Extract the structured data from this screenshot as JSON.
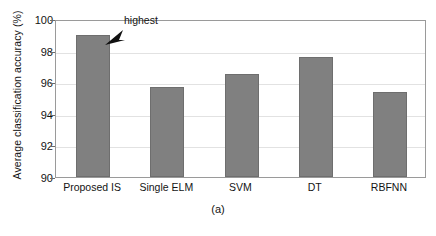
{
  "chart_data": {
    "type": "bar",
    "title": "",
    "subtitle": "",
    "xlabel": "",
    "ylabel": "Average classification accuracy (%)",
    "categories": [
      "Proposed IS",
      "Single  ELM",
      "SVM",
      "DT",
      "RBFNN"
    ],
    "values": [
      99.0,
      95.7,
      96.5,
      97.6,
      95.4
    ],
    "ylim": [
      90,
      100
    ],
    "yticks": [
      90,
      92,
      94,
      96,
      98,
      100
    ],
    "ytick_labels": [
      "90",
      "92",
      "94",
      "96",
      "98",
      "100"
    ],
    "grid": true,
    "grid_axis": "y",
    "legend": null,
    "legend_position": "none",
    "bar_color": "#808080",
    "bar_edge_color": "#6e6e6e",
    "annotations": [
      {
        "text": "highest",
        "target_category": "Proposed IS",
        "target_value": 99.0,
        "arrow": "down-left-arrowhead"
      }
    ],
    "caption": "(a)"
  },
  "figure": {
    "caption": "(a)",
    "y_axis_title": "Average classification accuracy (%)",
    "annotation_label": "highest"
  },
  "icons": {
    "annotation_arrow": "arrow-down-left-icon"
  }
}
